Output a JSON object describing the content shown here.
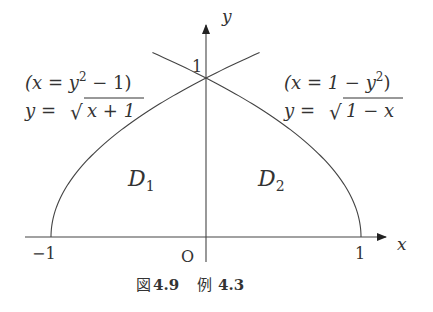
{
  "axes": {
    "x_label": "x",
    "y_label": "y",
    "origin_label": "O",
    "x_tick_labels": [
      "−1",
      "1"
    ],
    "y_tick_label": "1"
  },
  "curves": {
    "left": {
      "implicit_lhs": "(x = y",
      "implicit_exp": "2",
      "implicit_rhs": " − 1)",
      "explicit_lhs": "y = ",
      "explicit_radicand": "x + 1"
    },
    "right": {
      "implicit_lhs": "(x = 1 − y",
      "implicit_exp": "2",
      "implicit_rhs": ")",
      "explicit_lhs": "y = ",
      "explicit_radicand": "1 − x"
    }
  },
  "regions": {
    "d1_main": "D",
    "d1_sub": "1",
    "d2_main": "D",
    "d2_sub": "2"
  },
  "caption": {
    "figure_prefix": "図",
    "figure_number": "4.9",
    "example_prefix": "例",
    "example_number": "4.3"
  }
}
